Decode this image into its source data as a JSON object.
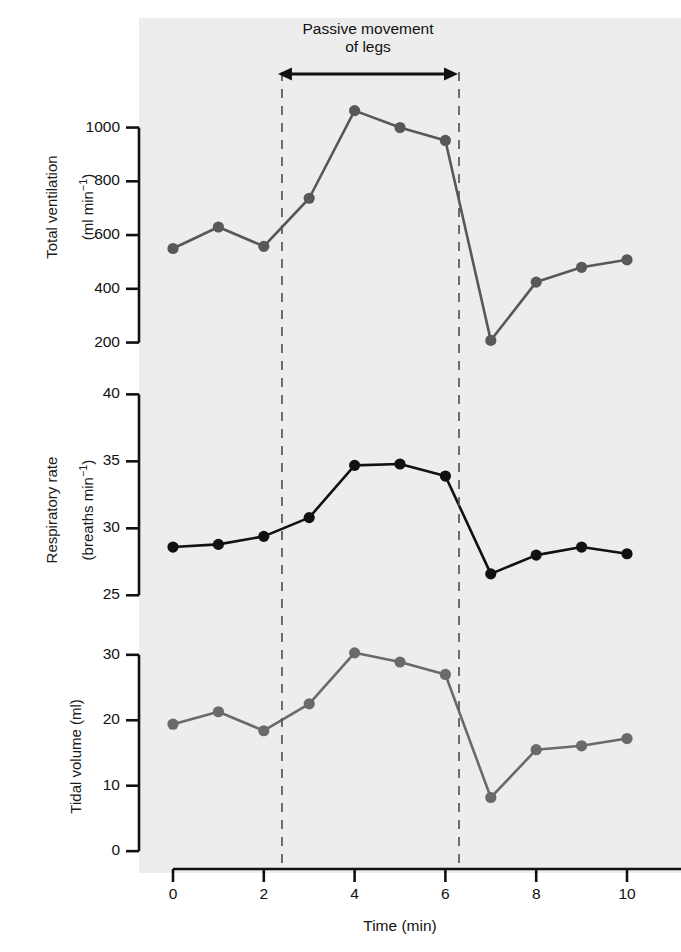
{
  "figure": {
    "background_color": "#ededed",
    "page_color": "#ffffff",
    "annotation": "Passive movement\nof legs",
    "xaxis_title": "Time (min)",
    "axis_color": "#111111",
    "dash_color": "#555555"
  },
  "chart_data": {
    "type": "line",
    "title": "Passive movement of legs",
    "xlabel": "Time (min)",
    "x": [
      0,
      1,
      2,
      3,
      4,
      5,
      6,
      7,
      8,
      9,
      10
    ],
    "xlim": [
      -0.5,
      10.8
    ],
    "xticks": [
      0,
      2,
      4,
      6,
      8,
      10
    ],
    "xticklabels": [
      "0",
      "2",
      "4",
      "6",
      "8",
      "10"
    ],
    "grid": false,
    "legend": "none",
    "annotations": [
      {
        "text": "Passive movement\nof legs",
        "type": "span-arrow",
        "x_start": 2.4,
        "x_end": 6.3
      },
      {
        "text": "",
        "type": "vline-dashed",
        "x": 2.4
      },
      {
        "text": "",
        "type": "vline-dashed",
        "x": 6.3
      }
    ],
    "panels": [
      {
        "id": "total-ventilation",
        "ylabel": "Total ventilation\n(ml min⁻¹)",
        "ylabel_line1": "Total ventilation",
        "ylabel_line2": "(ml min⁻¹)",
        "units": "ml min⁻¹",
        "yticks": [
          200,
          400,
          600,
          800,
          1000
        ],
        "yticklabels": [
          "200",
          "400",
          "600",
          "800",
          "1000"
        ],
        "ylim": [
          150,
          1110
        ],
        "series_color": "#585858",
        "values": [
          550,
          630,
          558,
          737,
          1063,
          1000,
          952,
          208,
          425,
          480,
          508
        ]
      },
      {
        "id": "respiratory-rate",
        "ylabel": "Respiratory rate\n(breaths min⁻¹)",
        "ylabel_line1": "Respiratory rate",
        "ylabel_line2": "(breaths min⁻¹)",
        "units": "breaths min⁻¹",
        "yticks": [
          25,
          30,
          35,
          40
        ],
        "yticklabels": [
          "25",
          "30",
          "35",
          "40"
        ],
        "ylim": [
          24.2,
          40.4
        ],
        "series_color": "#111111",
        "values": [
          28.6,
          28.8,
          29.4,
          30.8,
          34.7,
          34.8,
          33.9,
          26.6,
          28.0,
          28.6,
          28.1
        ]
      },
      {
        "id": "tidal-volume",
        "ylabel": "Tidal volume (ml)",
        "ylabel_line1": "Tidal volume (ml)",
        "ylabel_line2": "",
        "units": "ml",
        "yticks": [
          0,
          10,
          20,
          30
        ],
        "yticklabels": [
          "0",
          "10",
          "20",
          "30"
        ],
        "ylim": [
          -1.2,
          31.5
        ],
        "series_color": "#6a6a6a",
        "values": [
          19.4,
          21.3,
          18.4,
          22.5,
          30.3,
          28.9,
          27.0,
          8.2,
          15.5,
          16.1,
          17.2
        ]
      }
    ]
  }
}
